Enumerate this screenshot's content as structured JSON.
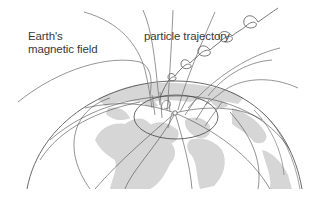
{
  "diagram": {
    "labels": {
      "earth_field_line1": "Earth's",
      "earth_field_line2": "magnetic field",
      "particle": "particle trajectory"
    },
    "colors": {
      "background": "#ffffff",
      "continents": "#d4d4d4",
      "lines": "#555555",
      "field_lines": "#777777",
      "text": "#3a3a3a"
    },
    "elements": [
      "globe",
      "latitude-longitude-grid",
      "continents",
      "auroral-oval",
      "magnetic-pole",
      "magnetic-field-lines",
      "helical-particle-trajectory"
    ]
  }
}
